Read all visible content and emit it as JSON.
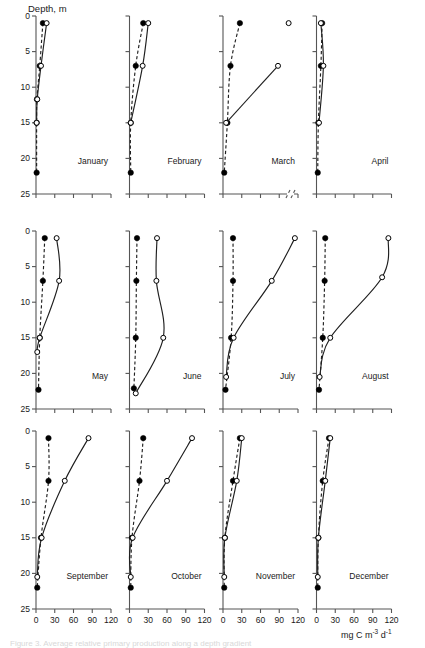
{
  "figure": {
    "y_axis_label": "Depth, m",
    "x_axis_label_parts": {
      "prefix": "mg C m",
      "exp1": "-3",
      "mid": " d",
      "exp2": "-1"
    },
    "x_axis_label": "mg C m-3 d-1",
    "caption": "Figure 3. Average relative primary production along a depth gradient",
    "series": [
      {
        "name": "dark-bottle",
        "marker": "filled-circle",
        "line": "dashed"
      },
      {
        "name": "light-bottle",
        "marker": "open-circle",
        "line": "solid"
      }
    ]
  },
  "axes": {
    "y_ticks": [
      0,
      5,
      10,
      15,
      20,
      25
    ],
    "y_tick_labels": [
      "0",
      "5",
      "10",
      "15",
      "20",
      "25"
    ],
    "y_range": [
      0,
      25
    ],
    "x_ticks": [
      0,
      30,
      60,
      90,
      120
    ],
    "x_tick_labels": [
      "0",
      "30",
      "60",
      "90",
      "120"
    ],
    "x_range": [
      0,
      120
    ],
    "grid": false
  },
  "chart_data": {
    "type": "line",
    "title": "",
    "subtitle": "",
    "xlabel": "mg C m-3 d-1",
    "ylabel": "Depth, m",
    "xlim": [
      0,
      120
    ],
    "ylim": [
      0,
      25
    ],
    "y_inverted": true,
    "grid": false,
    "legend_position": "none",
    "panel_layout": {
      "rows": 3,
      "cols": 4
    },
    "axis_break_panels": [
      "March"
    ],
    "panels": [
      {
        "label": "January",
        "row": 1,
        "col": 1,
        "series": [
          {
            "name": "dark-bottle",
            "style": "dashed",
            "marker": "filled-circle",
            "depths": [
              1,
              7,
              11.7,
              15,
              22
            ],
            "values": [
              11,
              6,
              1.5,
              1,
              1
            ]
          },
          {
            "name": "light-bottle",
            "style": "solid",
            "marker": "open-circle",
            "depths": [
              1,
              7,
              11.7,
              15
            ],
            "values": [
              17,
              8,
              2,
              1
            ]
          }
        ]
      },
      {
        "label": "February",
        "row": 1,
        "col": 2,
        "series": [
          {
            "name": "dark-bottle",
            "style": "dashed",
            "marker": "filled-circle",
            "depths": [
              1,
              7,
              15,
              22
            ],
            "values": [
              22,
              10,
              2,
              2
            ]
          },
          {
            "name": "light-bottle",
            "style": "solid",
            "marker": "open-circle",
            "depths": [
              1,
              7,
              15
            ],
            "values": [
              30,
              21,
              2
            ]
          }
        ]
      },
      {
        "label": "March",
        "row": 1,
        "col": 3,
        "series": [
          {
            "name": "dark-bottle",
            "style": "dashed",
            "marker": "filled-circle",
            "depths": [
              1,
              7,
              15,
              22
            ],
            "values": [
              27,
              12,
              7,
              2
            ]
          },
          {
            "name": "light-bottle",
            "style": "solid",
            "marker": "open-circle",
            "depths": [
              1,
              7,
              15
            ],
            "values": [
              105,
              88,
              5
            ]
          }
        ]
      },
      {
        "label": "April",
        "row": 1,
        "col": 4,
        "series": [
          {
            "name": "dark-bottle",
            "style": "dashed",
            "marker": "filled-circle",
            "depths": [
              1,
              7,
              15,
              22
            ],
            "values": [
              9,
              7,
              3,
              2
            ]
          },
          {
            "name": "light-bottle",
            "style": "solid",
            "marker": "open-circle",
            "depths": [
              1,
              7,
              15
            ],
            "values": [
              7,
              11,
              4
            ]
          }
        ]
      },
      {
        "label": "May",
        "row": 2,
        "col": 1,
        "series": [
          {
            "name": "dark-bottle",
            "style": "dashed",
            "marker": "filled-circle",
            "depths": [
              1,
              7,
              15,
              22.3
            ],
            "values": [
              14,
              11,
              6,
              4
            ]
          },
          {
            "name": "light-bottle",
            "style": "solid",
            "marker": "open-circle",
            "depths": [
              1,
              7,
              15,
              17
            ],
            "values": [
              33,
              37,
              6,
              2
            ]
          }
        ]
      },
      {
        "label": "June",
        "row": 2,
        "col": 2,
        "series": [
          {
            "name": "dark-bottle",
            "style": "dashed",
            "marker": "filled-circle",
            "depths": [
              1,
              7,
              15,
              22.1
            ],
            "values": [
              12,
              11,
              10,
              7
            ]
          },
          {
            "name": "light-bottle",
            "style": "solid",
            "marker": "open-circle",
            "depths": [
              1,
              7,
              15,
              22.8
            ],
            "values": [
              44,
              43,
              54,
              10
            ]
          }
        ]
      },
      {
        "label": "July",
        "row": 2,
        "col": 3,
        "series": [
          {
            "name": "dark-bottle",
            "style": "dashed",
            "marker": "filled-circle",
            "depths": [
              1,
              7,
              15,
              22.3
            ],
            "values": [
              16,
              16,
              13,
              4
            ]
          },
          {
            "name": "light-bottle",
            "style": "solid",
            "marker": "open-circle",
            "depths": [
              1,
              7,
              15,
              20.5
            ],
            "values": [
              115,
              78,
              17,
              5
            ]
          }
        ]
      },
      {
        "label": "August",
        "row": 2,
        "col": 4,
        "series": [
          {
            "name": "dark-bottle",
            "style": "dashed",
            "marker": "filled-circle",
            "depths": [
              1,
              7,
              15,
              22.3
            ],
            "values": [
              14,
              13,
              10,
              4
            ]
          },
          {
            "name": "light-bottle",
            "style": "solid",
            "marker": "open-circle",
            "depths": [
              1,
              6.5,
              15,
              20.5
            ],
            "values": [
              115,
              105,
              22,
              5
            ]
          }
        ]
      },
      {
        "label": "September",
        "row": 3,
        "col": 1,
        "series": [
          {
            "name": "dark-bottle",
            "style": "dashed",
            "marker": "filled-circle",
            "depths": [
              1,
              7,
              15,
              22
            ],
            "values": [
              20,
              20,
              8,
              2
            ]
          },
          {
            "name": "light-bottle",
            "style": "solid",
            "marker": "open-circle",
            "depths": [
              1,
              7,
              15,
              20.5
            ],
            "values": [
              84,
              46,
              9,
              2
            ]
          }
        ]
      },
      {
        "label": "October",
        "row": 3,
        "col": 2,
        "series": [
          {
            "name": "dark-bottle",
            "style": "dashed",
            "marker": "filled-circle",
            "depths": [
              1,
              7,
              15,
              22
            ],
            "values": [
              22,
              16,
              4,
              2
            ]
          },
          {
            "name": "light-bottle",
            "style": "solid",
            "marker": "open-circle",
            "depths": [
              1,
              7,
              15,
              20.5
            ],
            "values": [
              100,
              60,
              5,
              2
            ]
          }
        ]
      },
      {
        "label": "November",
        "row": 3,
        "col": 3,
        "series": [
          {
            "name": "dark-bottle",
            "style": "dashed",
            "marker": "filled-circle",
            "depths": [
              1,
              7,
              15,
              22
            ],
            "values": [
              27,
              16,
              3,
              2
            ]
          },
          {
            "name": "light-bottle",
            "style": "solid",
            "marker": "open-circle",
            "depths": [
              1,
              7,
              15,
              20.5
            ],
            "values": [
              30,
              22,
              3,
              2
            ]
          }
        ]
      },
      {
        "label": "December",
        "row": 3,
        "col": 4,
        "series": [
          {
            "name": "dark-bottle",
            "style": "dashed",
            "marker": "filled-circle",
            "depths": [
              1,
              7,
              15,
              22
            ],
            "values": [
              20,
              10,
              3,
              2
            ]
          },
          {
            "name": "light-bottle",
            "style": "solid",
            "marker": "open-circle",
            "depths": [
              1,
              7,
              15,
              20.5
            ],
            "values": [
              22,
              14,
              3,
              2
            ]
          }
        ]
      }
    ]
  }
}
